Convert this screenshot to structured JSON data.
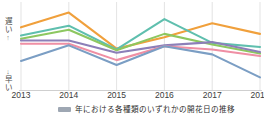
{
  "axis": {
    "y_top_label": "遅い",
    "y_top_arrow": "↑",
    "y_bottom_arrow": "↓",
    "y_bottom_label": "早い",
    "y_chars_top": [
      "遅",
      "い"
    ],
    "y_chars_bottom": [
      "早",
      "い"
    ]
  },
  "caption": {
    "text": "年における各種類のいずれかの開花日の推移",
    "swatch_color": "#9ea7b3"
  },
  "colors": {
    "orange": "#f0a03c",
    "teal": "#5fbfae",
    "green": "#8dc760",
    "purple": "#8c7fb8",
    "pink": "#ef8fa4",
    "blue": "#7b9ec4",
    "grid": "#dcdcdc",
    "axis_text": "#3c3c3c"
  },
  "chart_data": {
    "type": "line",
    "title": "",
    "xlabel": "",
    "ylabel": "遅い ↑ ↓ 早い",
    "categories": [
      "2013",
      "2014",
      "2015",
      "2016",
      "2017",
      "2018"
    ],
    "x": [
      2013,
      2014,
      2015,
      2016,
      2017,
      2018
    ],
    "ylim": [
      0,
      100
    ],
    "y_inverted": false,
    "grid": true,
    "grid_axis": "x",
    "legend": "none",
    "series": [
      {
        "name": "series-orange",
        "color": "#f0a03c",
        "values": [
          74,
          92,
          48,
          62,
          79,
          66
        ]
      },
      {
        "name": "series-teal",
        "color": "#5fbfae",
        "values": [
          64,
          76,
          47,
          84,
          55,
          50
        ]
      },
      {
        "name": "series-green",
        "color": "#8dc760",
        "values": [
          60,
          71,
          46,
          66,
          53,
          42
        ]
      },
      {
        "name": "series-purple",
        "color": "#8c7fb8",
        "values": [
          58,
          58,
          43,
          52,
          56,
          44
        ]
      },
      {
        "name": "series-pink",
        "color": "#ef8fa4",
        "values": [
          54,
          54,
          34,
          51,
          47,
          39
        ]
      },
      {
        "name": "series-blue",
        "color": "#7b9ec4",
        "values": [
          33,
          52,
          28,
          51,
          41,
          13
        ]
      }
    ]
  }
}
